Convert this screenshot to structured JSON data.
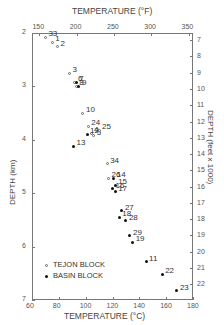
{
  "chart_data": {
    "type": "scatter",
    "title_top": "TEMPERATURE (°F)",
    "xlabel": "TEMPERATURE (°C)",
    "ylabel_left": "DEPTH (km)",
    "ylabel_right": "DEPTH (feet x 1000)",
    "x_ticks_c": [
      "60",
      "80",
      "100",
      "120",
      "140",
      "160",
      "180"
    ],
    "x_ticks_f": [
      "150",
      "200",
      "250",
      "300",
      "350"
    ],
    "y_ticks_km": [
      "2",
      "3",
      "4",
      "5",
      "6",
      "7"
    ],
    "y_ticks_ft": [
      "7",
      "8",
      "9",
      "10",
      "11",
      "12",
      "13",
      "14",
      "15",
      "16",
      "17",
      "18",
      "19",
      "20",
      "21",
      "22"
    ],
    "xlim": [
      60,
      180
    ],
    "ylim": [
      2,
      7
    ],
    "grid": false,
    "legend": [
      {
        "name": "TEJON BLOCK",
        "marker": "open-circle"
      },
      {
        "name": "BASIN BLOCK",
        "marker": "filled-dot"
      }
    ],
    "series": [
      {
        "name": "TEJON BLOCK",
        "points": [
          {
            "id": "33",
            "t": 70,
            "d": 2.08
          },
          {
            "id": "1",
            "t": 75,
            "d": 2.17
          },
          {
            "id": "2",
            "t": 79,
            "d": 2.26
          },
          {
            "id": "3",
            "t": 88,
            "d": 2.75
          },
          {
            "id": "6",
            "t": 92,
            "d": 2.92
          },
          {
            "id": "8",
            "t": 93,
            "d": 3.0
          },
          {
            "id": "10",
            "t": 98,
            "d": 3.5
          },
          {
            "id": "24",
            "t": 102,
            "d": 3.75
          },
          {
            "id": "4",
            "t": 104,
            "d": 3.88
          },
          {
            "id": "5",
            "t": 106,
            "d": 3.92
          },
          {
            "id": "25",
            "t": 110,
            "d": 3.82
          },
          {
            "id": "34",
            "t": 116,
            "d": 4.45
          },
          {
            "id": "26",
            "t": 117,
            "d": 4.72
          }
        ]
      },
      {
        "name": "BASIN BLOCK",
        "points": [
          {
            "id": "7",
            "t": 93,
            "d": 2.92
          },
          {
            "id": "9",
            "t": 95,
            "d": 3.0
          },
          {
            "id": "12",
            "t": 101,
            "d": 3.9
          },
          {
            "id": "13",
            "t": 91,
            "d": 4.12
          },
          {
            "id": "14",
            "t": 121,
            "d": 4.72
          },
          {
            "id": "15",
            "t": 122,
            "d": 4.85
          },
          {
            "id": "16",
            "t": 120,
            "d": 4.92
          },
          {
            "id": "17",
            "t": 122,
            "d": 4.97
          },
          {
            "id": "27",
            "t": 127,
            "d": 5.33
          },
          {
            "id": "18",
            "t": 125,
            "d": 5.45
          },
          {
            "id": "28",
            "t": 130,
            "d": 5.52
          },
          {
            "id": "29",
            "t": 133,
            "d": 5.8
          },
          {
            "id": "19",
            "t": 135,
            "d": 5.92
          },
          {
            "id": "11",
            "t": 145,
            "d": 6.28
          },
          {
            "id": "22",
            "t": 157,
            "d": 6.52
          },
          {
            "id": "23",
            "t": 168,
            "d": 6.83
          }
        ]
      }
    ]
  }
}
